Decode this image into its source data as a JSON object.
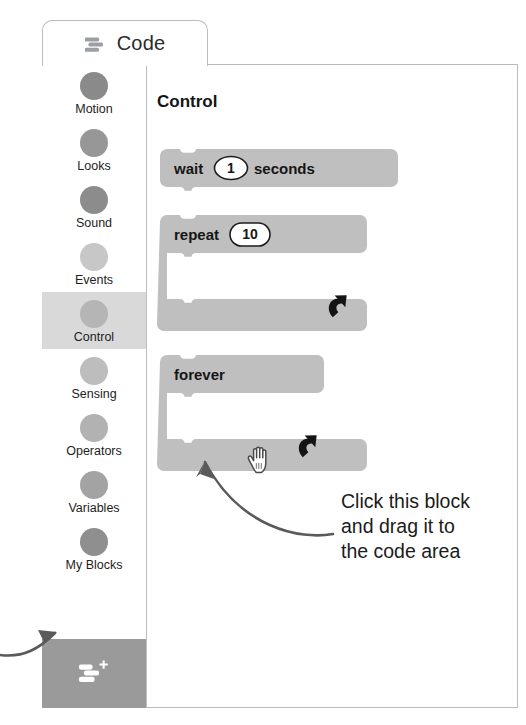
{
  "tab": {
    "label": "Code",
    "icon": "code-blocks-icon"
  },
  "sidebar": {
    "categories": [
      {
        "label": "Motion",
        "color": "#8a8a8a",
        "selected": false
      },
      {
        "label": "Looks",
        "color": "#979797",
        "selected": false
      },
      {
        "label": "Sound",
        "color": "#8c8c8c",
        "selected": false
      },
      {
        "label": "Events",
        "color": "#c7c7c7",
        "selected": false
      },
      {
        "label": "Control",
        "color": "#b5b5b5",
        "selected": true
      },
      {
        "label": "Sensing",
        "color": "#bdbdbd",
        "selected": false
      },
      {
        "label": "Operators",
        "color": "#b2b2b2",
        "selected": false
      },
      {
        "label": "Variables",
        "color": "#a3a3a3",
        "selected": false
      },
      {
        "label": "My Blocks",
        "color": "#8f8f8f",
        "selected": false
      }
    ],
    "add_extension": {
      "icon": "add-extension-icon",
      "background": "#9a9a9a"
    }
  },
  "palette": {
    "heading": "Control",
    "block_color": "#bfbfbf",
    "blocks": [
      {
        "name": "wait-block",
        "type": "stack",
        "words": [
          "wait",
          "seconds"
        ],
        "value": "1"
      },
      {
        "name": "repeat-block",
        "type": "c-block",
        "words": [
          "repeat"
        ],
        "value": "10",
        "loop_icon": "loop-arrow-icon"
      },
      {
        "name": "forever-block",
        "type": "c-block",
        "words": [
          "forever"
        ],
        "value": "",
        "loop_icon": "loop-arrow-icon"
      }
    ]
  },
  "annotations": {
    "callout": {
      "lines": [
        "Click this block",
        "and drag it to",
        "the code area"
      ],
      "arrow": "curved-arrow-to-forever-block",
      "color": "#5a5a5a"
    },
    "extension_pointer": {
      "arrow": "curved-arrow-to-add-extension",
      "color": "#5a5a5a"
    },
    "cursor": {
      "icon": "open-hand-cursor",
      "x": 259,
      "y": 462
    }
  }
}
